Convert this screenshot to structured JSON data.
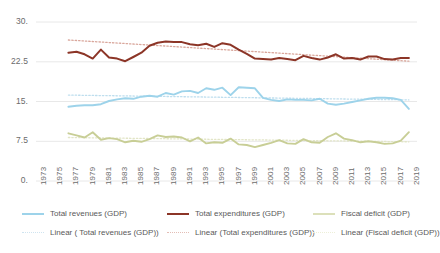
{
  "chart_data": {
    "type": "line",
    "title": "",
    "xlabel": "",
    "ylabel": "",
    "ylim": [
      0,
      30
    ],
    "yticks": [
      "0.",
      "7.5",
      "15.",
      "22.5",
      "30."
    ],
    "ytick_values": [
      0,
      7.5,
      15,
      22.5,
      30
    ],
    "grid": true,
    "legend_position": "bottom",
    "xlim": [
      1973,
      2020
    ],
    "categories": [
      1977,
      1978,
      1979,
      1980,
      1981,
      1982,
      1983,
      1984,
      1985,
      1986,
      1987,
      1988,
      1989,
      1990,
      1991,
      1992,
      1993,
      1994,
      1995,
      1996,
      1997,
      1998,
      1999,
      2000,
      2001,
      2002,
      2003,
      2004,
      2005,
      2006,
      2007,
      2008,
      2009,
      2010,
      2011,
      2012,
      2013,
      2014,
      2015,
      2016,
      2017,
      2018,
      2019
    ],
    "xticks": [
      "1973",
      "1975",
      "1977",
      "1979",
      "1981",
      "1983",
      "1985",
      "1987",
      "1989",
      "1991",
      "1993",
      "1995",
      "1997",
      "1999",
      "2001",
      "2003",
      "2005",
      "2007",
      "2009",
      "2011",
      "2013",
      "2015",
      "2017",
      "2019"
    ],
    "xtick_values": [
      1973,
      1975,
      1977,
      1979,
      1981,
      1983,
      1985,
      1987,
      1989,
      1991,
      1993,
      1995,
      1997,
      1999,
      2001,
      2003,
      2005,
      2007,
      2009,
      2011,
      2013,
      2015,
      2017,
      2019
    ],
    "series": [
      {
        "name": "Total revenues (GDP)",
        "color": "#9DD3EA",
        "style": "solid",
        "values": [
          14.0,
          14.2,
          14.3,
          14.3,
          14.5,
          15.1,
          15.4,
          15.6,
          15.5,
          15.9,
          16.1,
          15.9,
          16.6,
          16.3,
          16.9,
          17.0,
          16.6,
          17.5,
          17.2,
          17.6,
          16.2,
          17.7,
          17.6,
          17.5,
          15.7,
          15.3,
          15.1,
          15.4,
          15.3,
          15.3,
          15.2,
          15.5,
          14.6,
          14.4,
          14.6,
          14.9,
          15.2,
          15.5,
          15.7,
          15.7,
          15.6,
          15.3,
          13.6
        ]
      },
      {
        "name": "Total expenditures (GDP)",
        "color": "#8C3527",
        "style": "solid",
        "values": [
          24.2,
          24.4,
          23.9,
          23.1,
          24.8,
          23.3,
          23.1,
          22.6,
          23.4,
          24.2,
          25.5,
          26.1,
          26.3,
          26.2,
          26.2,
          25.8,
          25.6,
          25.9,
          25.3,
          26.0,
          25.7,
          24.8,
          24.0,
          23.1,
          23.0,
          22.9,
          23.2,
          23.0,
          22.8,
          23.6,
          23.2,
          22.9,
          23.3,
          23.9,
          23.1,
          23.2,
          22.9,
          23.5,
          23.5,
          23.0,
          22.9,
          23.2,
          23.2
        ]
      },
      {
        "name": "Fiscal deficit (GDP)",
        "color": "#C8CE96",
        "style": "solid",
        "values": [
          9.0,
          8.6,
          8.2,
          9.2,
          7.8,
          8.1,
          7.9,
          7.3,
          7.6,
          7.4,
          7.9,
          8.6,
          8.3,
          8.4,
          8.2,
          7.5,
          8.2,
          7.1,
          7.3,
          7.2,
          8.0,
          6.9,
          6.8,
          6.4,
          6.8,
          7.2,
          7.7,
          7.1,
          7.0,
          7.9,
          7.3,
          7.2,
          8.3,
          9.0,
          8.0,
          7.7,
          7.3,
          7.5,
          7.3,
          7.0,
          7.1,
          7.6,
          9.2
        ]
      }
    ],
    "trendlines": [
      {
        "name": "Linear ( Total revenues (GDP))",
        "color": "#BEDEEE",
        "style": "dotted",
        "start": [
          1977,
          16.2
        ],
        "end": [
          2019,
          15.3
        ]
      },
      {
        "name": "Linear (Total expenditures (GDP))",
        "color": "#D9A79C",
        "style": "dotted",
        "start": [
          1977,
          26.6
        ],
        "end": [
          2019,
          22.6
        ]
      },
      {
        "name": "Linear (Fiscal deficit (GDP))",
        "color": "#E2E5C7",
        "style": "dotted",
        "start": [
          1977,
          8.2
        ],
        "end": [
          2019,
          7.4
        ]
      }
    ]
  },
  "legend": {
    "row1": [
      {
        "label": "Total revenues (GDP)",
        "color": "#9DD3EA",
        "style": "solid"
      },
      {
        "label": "Total expenditures (GDP)",
        "color": "#8C3527",
        "style": "solid"
      },
      {
        "label": "Fiscal deficit (GDP)",
        "color": "#DCE0BA",
        "style": "solid"
      }
    ],
    "row2": [
      {
        "label": "Linear ( Total revenues (GDP))",
        "color": "#CFE4F0",
        "style": "dotted"
      },
      {
        "label": "Linear (Total expenditures (GDP))",
        "color": "#E3BDB5",
        "style": "dotted"
      },
      {
        "label": "Linear (Fiscal deficit (GDP))",
        "color": "#EDEFD8",
        "style": "dotted"
      }
    ]
  },
  "colors": {
    "grid": "#E8E8E8",
    "text": "#6b6b6b",
    "background": "#ffffff"
  }
}
